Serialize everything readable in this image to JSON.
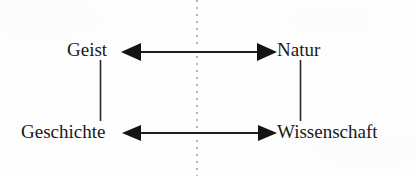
{
  "diagram": {
    "ink_color": "#1a1a1a",
    "divider_color": "#b6b6b6",
    "background_color": "#fefefe",
    "nodes": [
      {
        "id": "geist",
        "label": "Geist",
        "position": "top-left"
      },
      {
        "id": "natur",
        "label": "Natur",
        "position": "top-right"
      },
      {
        "id": "geschichte",
        "label": "Geschichte",
        "position": "bottom-left"
      },
      {
        "id": "wissenschaft",
        "label": "Wissenschaft",
        "position": "bottom-right"
      }
    ],
    "edges": [
      {
        "id": "geist-natur",
        "from": "geist",
        "to": "natur",
        "style": "double-arrow",
        "orientation": "horizontal"
      },
      {
        "id": "geschichte-wissenschaft",
        "from": "geschichte",
        "to": "wissenschaft",
        "style": "double-arrow",
        "orientation": "horizontal"
      },
      {
        "id": "geist-geschichte",
        "from": "geist",
        "to": "geschichte",
        "style": "plain-line",
        "orientation": "vertical"
      },
      {
        "id": "natur-wissenschaft",
        "from": "natur",
        "to": "wissenschaft",
        "style": "plain-line",
        "orientation": "vertical"
      }
    ],
    "divider": {
      "id": "center-divider",
      "style": "dotted",
      "orientation": "vertical"
    }
  }
}
